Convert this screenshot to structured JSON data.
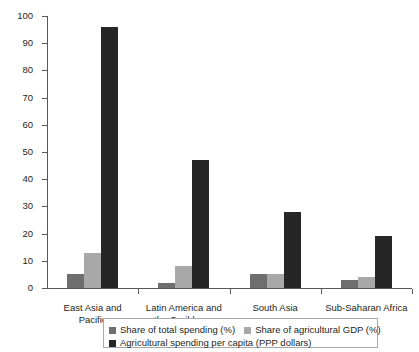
{
  "chart_data": {
    "type": "bar",
    "title": "",
    "subtitle": "",
    "xlabel": "",
    "ylabel": "Percent",
    "ylim": [
      0,
      100
    ],
    "yticks": [
      0,
      10,
      20,
      30,
      40,
      50,
      60,
      70,
      80,
      90,
      100
    ],
    "grid": false,
    "legend_position": "bottom",
    "categories": [
      "East Asia and Pacific",
      "Latin America and the Caribbean",
      "South Asia",
      "Sub-Saharan Africa"
    ],
    "series": [
      {
        "name": "Share of total spending (%)",
        "color": "#6e6e6e",
        "values": [
          5,
          2,
          5,
          3
        ]
      },
      {
        "name": "Share of agricultural GDP (%)",
        "color": "#a8a8a8",
        "values": [
          13,
          8,
          5,
          4
        ]
      },
      {
        "name": "Agricultural spending per capita (PPP dollars)",
        "color": "#262626",
        "values": [
          96,
          47,
          28,
          19
        ]
      }
    ]
  },
  "axis": {
    "y_title": "Percent",
    "tick_labels": [
      "100",
      "90",
      "80",
      "70",
      "60",
      "50",
      "40",
      "30",
      "20",
      "10",
      "0"
    ]
  },
  "category_labels": [
    {
      "line1": "East Asia and Pacific",
      "line2": ""
    },
    {
      "line1": "Latin America and",
      "line2": "the Caribbean"
    },
    {
      "line1": "South Asia",
      "line2": ""
    },
    {
      "line1": "Sub-Saharan Africa",
      "line2": ""
    }
  ],
  "legend": {
    "items": [
      "Share of total spending (%)",
      "Share of agricultural GDP (%)",
      "Agricultural spending per capita (PPP dollars)"
    ]
  }
}
